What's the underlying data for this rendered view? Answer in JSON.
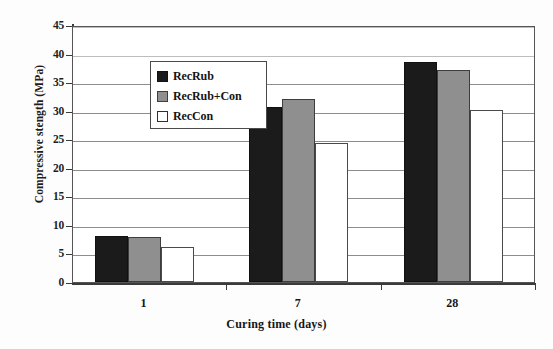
{
  "chart_data": {
    "type": "bar",
    "title": "",
    "xlabel": "Curing time (days)",
    "ylabel": "Compressive stength (MPa)",
    "categories": [
      "1",
      "7",
      "28"
    ],
    "series": [
      {
        "name": "RecRub",
        "values": [
          8.1,
          30.6,
          38.5
        ],
        "color": "#1b1b1b"
      },
      {
        "name": "RecRub+Con",
        "values": [
          7.8,
          32.1,
          37.2
        ],
        "color": "#8f8f8f"
      },
      {
        "name": "RecCon",
        "values": [
          6.2,
          24.3,
          30.2
        ],
        "color": "#ffffff"
      }
    ],
    "ylim": [
      0,
      45
    ],
    "ytick_step": 5,
    "yticks": [
      "45",
      "40",
      "35",
      "30",
      "25",
      "20",
      "15",
      "10",
      "5",
      "0"
    ],
    "grid": true,
    "grid_axis": "y",
    "legend_position": "upper-left",
    "units": "MPa"
  },
  "axes": {
    "y_title": "Compressive stength (MPa)",
    "x_title": "Curing time (days)"
  },
  "legend": {
    "entries": [
      {
        "label": "RecRub",
        "swatch": "black-square-swatch"
      },
      {
        "label": "RecRub+Con",
        "swatch": "gray-square-swatch"
      },
      {
        "label": "RecCon",
        "swatch": "white-square-swatch"
      }
    ]
  },
  "artifacts": {
    "smudge_a": "",
    "smudge_b": ""
  }
}
